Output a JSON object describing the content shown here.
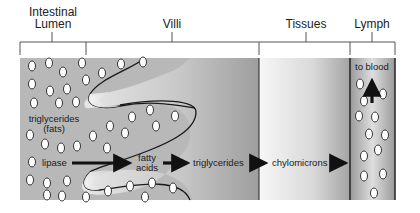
{
  "regions": [
    {
      "id": "lumen",
      "label_line1": "Intestinal",
      "label_line2": "Lumen"
    },
    {
      "id": "villi",
      "label": "Villi"
    },
    {
      "id": "tissues",
      "label": "Tissues"
    },
    {
      "id": "lymph",
      "label": "Lymph"
    }
  ],
  "annotations": {
    "triglycerides_fats_line1": "triglycerides",
    "triglycerides_fats_line2": "(fats)",
    "lipase": "lipase",
    "fatty_acids_line1": "fatty",
    "fatty_acids_line2": "acids",
    "triglycerides": "triglycerides",
    "chylomicrons": "chylomicrons",
    "to_blood": "to blood"
  },
  "flow": [
    "lipase",
    "fatty acids",
    "triglycerides",
    "chylomicrons",
    "to blood"
  ],
  "colors": {
    "lumen_bg": "#b4b4b4",
    "villus_fill": "#dcdcdc",
    "tissue_light": "#f2f2f2",
    "tissue_dark": "#9a9a9a",
    "arrow": "#111111",
    "line": "#333333"
  }
}
